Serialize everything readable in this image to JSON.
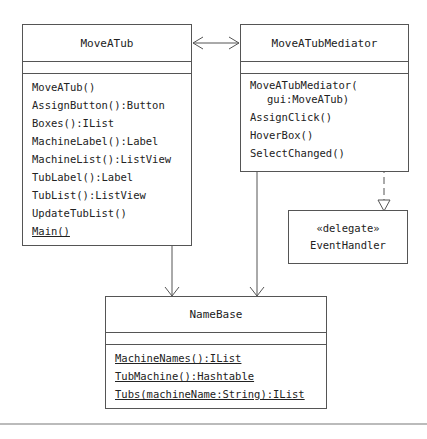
{
  "classes": {
    "moveatub": {
      "name": "MoveATub",
      "operations": [
        {
          "label": "MoveATub()",
          "static": false
        },
        {
          "label": "AssignButton():Button",
          "static": false
        },
        {
          "label": "Boxes():IList",
          "static": false
        },
        {
          "label": "MachineLabel():Label",
          "static": false
        },
        {
          "label": "MachineList():ListView",
          "static": false
        },
        {
          "label": "TubLabel():Label",
          "static": false
        },
        {
          "label": "TubList():ListView",
          "static": false
        },
        {
          "label": "UpdateTubList()",
          "static": false
        },
        {
          "label": "Main()",
          "static": true
        }
      ]
    },
    "mediator": {
      "name": "MoveATubMediator",
      "ctor_line1": "MoveATubMediator(",
      "ctor_line2": "gui:MoveATub)",
      "operations": [
        {
          "label": "AssignClick()"
        },
        {
          "label": "HoverBox()"
        },
        {
          "label": "SelectChanged()"
        }
      ]
    },
    "eventhandler": {
      "stereotype": "«delegate»",
      "name": "EventHandler"
    },
    "namebase": {
      "name": "NameBase",
      "operations": [
        {
          "label": "MachineNames():IList",
          "static": true
        },
        {
          "label": "TubMachine():Hashtable",
          "static": true
        },
        {
          "label": "Tubs(machineName:String):IList",
          "static": true
        }
      ]
    }
  },
  "colors": {
    "line": "#555555",
    "text": "#222222",
    "background": "#ffffff"
  }
}
